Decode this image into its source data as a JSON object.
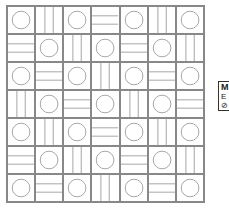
{
  "tile_grid": {
    "rows": 7,
    "cols": 7,
    "line_color": "#888888",
    "legend_key": {
      "C": "circle",
      "V": "vertical-lines",
      "H": "horizontal-lines"
    },
    "pattern": [
      [
        "C",
        "V",
        "C",
        "H",
        "C",
        "V",
        "C"
      ],
      [
        "H",
        "C",
        "V",
        "C",
        "H",
        "C",
        "V"
      ],
      [
        "C",
        "H",
        "C",
        "V",
        "C",
        "H",
        "C"
      ],
      [
        "V",
        "C",
        "H",
        "C",
        "V",
        "C",
        "H"
      ],
      [
        "C",
        "V",
        "C",
        "H",
        "C",
        "V",
        "C"
      ],
      [
        "H",
        "C",
        "V",
        "C",
        "H",
        "C",
        "V"
      ],
      [
        "C",
        "H",
        "C",
        "V",
        "C",
        "H",
        "C"
      ]
    ]
  },
  "side_panel": {
    "title": "M",
    "lines": [
      "E",
      "⊘"
    ]
  }
}
